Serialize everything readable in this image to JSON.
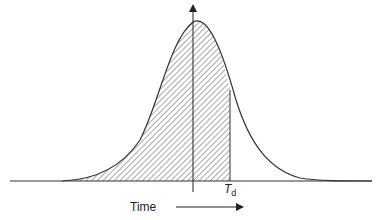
{
  "diagram": {
    "type": "bell-curve-shaded-area",
    "labels": {
      "threshold_main": "T",
      "threshold_sub": "d",
      "x_axis": "Time"
    },
    "colors": {
      "line": "#333333",
      "hatch": "#555555",
      "background": "#ffffff"
    }
  }
}
